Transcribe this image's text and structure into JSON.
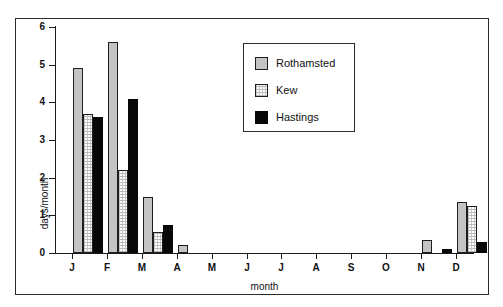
{
  "chart_data": {
    "type": "bar",
    "title": "",
    "xlabel": "month",
    "ylabel": "days/month",
    "categories": [
      "J",
      "F",
      "M",
      "A",
      "M",
      "J",
      "J",
      "A",
      "S",
      "O",
      "N",
      "D"
    ],
    "series": [
      {
        "name": "Rothamsted",
        "color": "#c4c4c4",
        "fill": "solid-grey",
        "values": [
          4.9,
          5.6,
          1.5,
          0.2,
          0,
          0,
          0,
          0,
          0,
          0,
          0.35,
          1.35
        ]
      },
      {
        "name": "Kew",
        "color": "#fdfdfd",
        "fill": "light-stipple",
        "values": [
          3.7,
          2.2,
          0.55,
          0,
          0,
          0,
          0,
          0,
          0,
          0,
          0,
          1.25
        ]
      },
      {
        "name": "Hastings",
        "color": "#080808",
        "fill": "solid-black",
        "values": [
          3.6,
          4.1,
          0.75,
          0,
          0,
          0,
          0,
          0,
          0,
          0,
          0.1,
          0.3
        ]
      }
    ],
    "ylim": [
      0,
      6
    ],
    "yticks": [
      0,
      1,
      2,
      3,
      4,
      5,
      6
    ],
    "ytick_labels": [
      "0",
      "1",
      "2",
      "3",
      "4",
      "5",
      "6"
    ],
    "grid": false,
    "legend_position": "upper-center",
    "legend_entries": [
      "Rothamsted",
      "Kew",
      "Hastings"
    ]
  }
}
